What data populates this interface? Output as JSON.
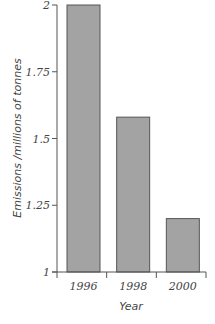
{
  "chart_data": {
    "type": "bar",
    "title": "",
    "categories": [
      "1996",
      "1998",
      "2000"
    ],
    "values": [
      2.0,
      1.58,
      1.2
    ],
    "xlabel": "Year",
    "ylabel": "Emissions /millions of tonnes",
    "ylim": [
      1,
      2
    ],
    "yticks": [
      1,
      1.25,
      1.5,
      1.75,
      2
    ],
    "ytick_labels": [
      "1",
      "1.25",
      "1.5",
      "1.75",
      "2"
    ],
    "grid": false,
    "legend": null,
    "bar_color": "#a3a3a3",
    "bar_edge_color": "#555555"
  }
}
